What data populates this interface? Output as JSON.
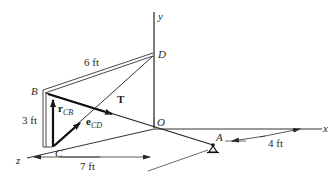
{
  "figure": {
    "type": "3d-statics-diagram",
    "axes": {
      "x": "x",
      "y": "y",
      "z": "z"
    },
    "points": {
      "O": "O",
      "A": "A",
      "B": "B",
      "C": "C",
      "D": "D"
    },
    "vectors": {
      "tension": "T",
      "r_CB_main": "r",
      "r_CB_sub": "CB",
      "e_CD_main": "e",
      "e_CD_sub": "CD"
    },
    "dimensions": {
      "BD_length": "6 ft",
      "BC_height": "3 ft",
      "z_to_A_distance": "7 ft",
      "A_to_x_offset": "4 ft"
    },
    "support": "pin-support-at-A"
  }
}
